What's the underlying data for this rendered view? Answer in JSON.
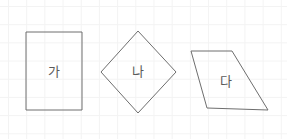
{
  "canvas": {
    "width": 287,
    "height": 139,
    "background_color": "#ffffff",
    "grid": {
      "visible": true,
      "cell_size": 18,
      "color": "#f3f3f3"
    }
  },
  "style": {
    "stroke_color": "#6e6e6e",
    "stroke_width": 1,
    "fill_color": "#ffffff",
    "label_color": "#5a5a5a",
    "label_font_size": 13
  },
  "figures": [
    {
      "id": "rectangle",
      "label": "가",
      "shape_type": "rectangle",
      "points": "26,32 82,32 82,110 26,110",
      "label_x": 54,
      "label_y": 71
    },
    {
      "id": "rhombus",
      "label": "나",
      "shape_type": "rhombus",
      "points": "138,31 176,72 138,113 101,72",
      "label_x": 138,
      "label_y": 71
    },
    {
      "id": "parallelogram",
      "label": "다",
      "shape_type": "parallelogram",
      "points": "191,51 232,51 268,110 207,108",
      "label_x": 226,
      "label_y": 81
    }
  ]
}
